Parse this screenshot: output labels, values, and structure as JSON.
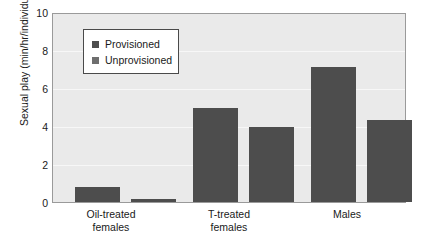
{
  "chart_data": {
    "type": "bar",
    "title": "",
    "xlabel": "",
    "ylabel": "Sexual play (min/hr/individual)",
    "categories": [
      "Oil-treated females",
      "T-treated females",
      "Males"
    ],
    "category_lines": [
      [
        "Oil-treated",
        "females"
      ],
      [
        "T-treated",
        "females"
      ],
      [
        "Males",
        ""
      ]
    ],
    "series": [
      {
        "name": "Provisioned",
        "values": [
          0.8,
          5.0,
          7.2
        ],
        "color": "#4d4d4d"
      },
      {
        "name": "Unprovisioned",
        "values": [
          0.15,
          4.0,
          4.35
        ],
        "color": "#4d4d4d"
      }
    ],
    "ylim": [
      0,
      10
    ],
    "yticks": [
      0,
      2,
      4,
      6,
      8,
      10
    ],
    "ytick_labels": [
      "0",
      "2",
      "4",
      "6",
      "8",
      "10"
    ],
    "grid": true,
    "grid_color": "#f7f7f7",
    "legend_position": "upper-left-inside",
    "legend_swatch_colors": [
      "#4d4d4d",
      "#6e6e6e"
    ],
    "plot_background": "#eaeaea",
    "frame_color": "#9a9a9a"
  }
}
